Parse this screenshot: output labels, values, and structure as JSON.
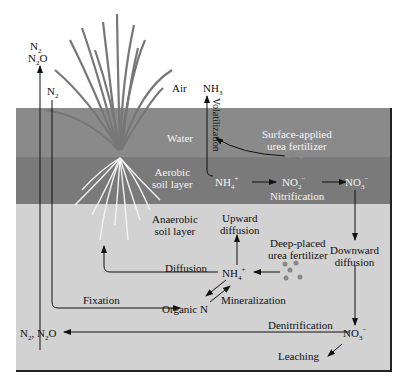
{
  "diagram": {
    "type": "nitrogen-cycle-flooded-soil",
    "layers": {
      "air": "Air",
      "water": "Water",
      "aerobic": [
        "Aerobic",
        "soil layer"
      ],
      "anaerobic": [
        "Anaerobic",
        "soil layer"
      ]
    },
    "species": {
      "n2_top": "N",
      "n2o_top": "N",
      "n2_mid": "N",
      "nh3": "NH",
      "nh4_aerobic": "NH",
      "no2": "NO",
      "no3_aerobic": "NO",
      "nh4_anaerobic": "NH",
      "organic_n": "Organic N",
      "no3_anaerobic": "NO",
      "n2_n2o_bottom": "N"
    },
    "sub_sup": {
      "two": "2",
      "three": "3",
      "four": "4",
      "plus": "+",
      "minus": "−",
      "o": "O",
      "comma_n": ", N"
    },
    "processes": {
      "volatilization": "Volatilization",
      "surface_fertilizer": [
        "Surface-applied",
        "urea fertilizer"
      ],
      "nitrification": "Nitrification",
      "upward_diffusion": [
        "Upward",
        "diffusion"
      ],
      "deep_fertilizer": [
        "Deep-placed",
        "urea fertilizer"
      ],
      "downward_diffusion": [
        "Downward",
        "diffusion"
      ],
      "diffusion": "Diffusion",
      "fixation": "Fixation",
      "mineralization": "Mineralization",
      "denitrification": "Denitrification",
      "leaching": "Leaching"
    },
    "colors": {
      "water": "#8a8a8a",
      "aerobic": "#7a7a7a",
      "anaerobic": "#d2d2d2",
      "arrow": "#111111"
    }
  }
}
